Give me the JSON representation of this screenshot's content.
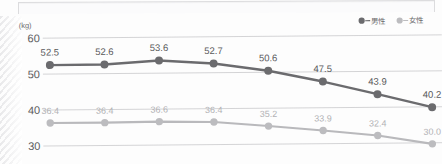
{
  "axis": {
    "unit_label": "(kg)",
    "y_ticks": [
      "60",
      "50",
      "40",
      "30"
    ]
  },
  "legend": {
    "male_label": "男性",
    "female_label": "女性",
    "male_color": "#6b6b6e",
    "female_color": "#bcbcbf",
    "separator": "—"
  },
  "labels": {
    "male": [
      "52.5",
      "52.6",
      "53.6",
      "52.7",
      "50.6",
      "47.5",
      "43.9",
      "40.2"
    ],
    "female": [
      "36.4",
      "36.4",
      "36.6",
      "36.4",
      "35.2",
      "33.9",
      "32.4",
      "30.0"
    ]
  },
  "chart_data": {
    "type": "line",
    "title": "",
    "xlabel": "",
    "ylabel": "(kg)",
    "ylim": [
      25,
      62
    ],
    "yticks": [
      60,
      50,
      40,
      30
    ],
    "grid": true,
    "legend_position": "top-right",
    "categories": [
      "1",
      "2",
      "3",
      "4",
      "5",
      "6",
      "7",
      "8"
    ],
    "series": [
      {
        "name": "男性",
        "color": "#6b6b6e",
        "values": [
          52.5,
          52.6,
          53.6,
          52.7,
          50.6,
          47.5,
          43.9,
          40.2
        ]
      },
      {
        "name": "女性",
        "color": "#bcbcbf",
        "values": [
          36.4,
          36.4,
          36.6,
          36.4,
          35.2,
          33.9,
          32.4,
          30.0
        ]
      }
    ]
  }
}
